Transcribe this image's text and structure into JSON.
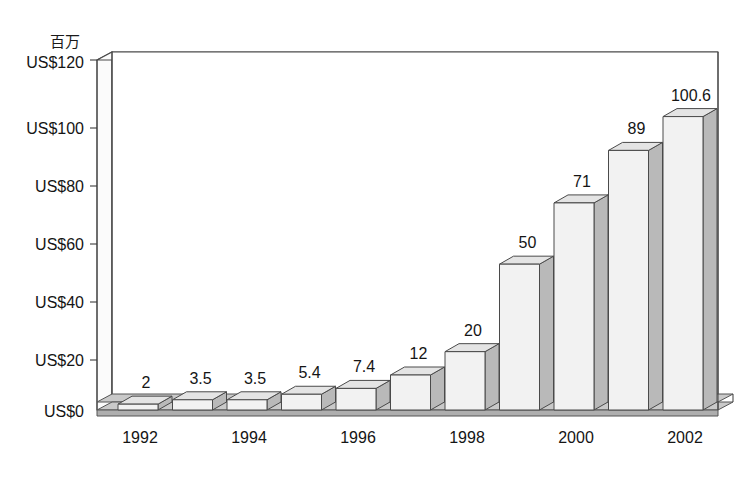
{
  "chart_data": {
    "type": "bar",
    "title": "",
    "subtitle": "",
    "xlabel": "",
    "ylabel": "百万",
    "unit_label": "百万",
    "categories": [
      "1992",
      "1993",
      "1994",
      "1995",
      "1996",
      "1997",
      "1998",
      "1999",
      "2000",
      "2001",
      "2002"
    ],
    "values": [
      2,
      3.5,
      3.5,
      5.4,
      7.4,
      12,
      20,
      50,
      71,
      89,
      100.6
    ],
    "value_labels": [
      "2",
      "3.5",
      "3.5",
      "5.4",
      "7.4",
      "12",
      "20",
      "50",
      "71",
      "89",
      "100.6"
    ],
    "x_tick_labels": [
      "1992",
      "",
      "1994",
      "",
      "1996",
      "",
      "1998",
      "",
      "2000",
      "",
      "2002"
    ],
    "visible_x_tick_labels": [
      "1992",
      "1994",
      "1996",
      "1998",
      "2000",
      "2002"
    ],
    "y_tick_labels": [
      "US$0",
      "US$20",
      "US$40",
      "US$60",
      "US$80",
      "US$100",
      "US$120"
    ],
    "y_tick_values": [
      0,
      20,
      40,
      60,
      80,
      100,
      120
    ],
    "ylim": [
      0,
      120
    ],
    "grid": false,
    "legend": false,
    "legend_position": "none",
    "style": "3d-column",
    "series": [
      {
        "name": "",
        "values": [
          2,
          3.5,
          3.5,
          5.4,
          7.4,
          12,
          20,
          50,
          71,
          89,
          100.6
        ]
      }
    ],
    "colors": {
      "bar_front": "#f2f2f2",
      "bar_side": "#b9b9b9",
      "bar_top": "#e4e4e4",
      "floor": "#c9c9c9",
      "outline": "#4a4a4a",
      "text": "#151515",
      "background": "#ffffff"
    }
  },
  "axis": {
    "unit_label": "百万",
    "y_ticks": [
      {
        "label": "US$120",
        "value": 120
      },
      {
        "label": "US$100",
        "value": 100
      },
      {
        "label": "US$80",
        "value": 80
      },
      {
        "label": "US$60",
        "value": 60
      },
      {
        "label": "US$40",
        "value": 40
      },
      {
        "label": "US$20",
        "value": 20
      },
      {
        "label": "US$0",
        "value": 0
      }
    ],
    "x_ticks": [
      {
        "label": "1992",
        "index": 0
      },
      {
        "label": "1994",
        "index": 2
      },
      {
        "label": "1996",
        "index": 4
      },
      {
        "label": "1998",
        "index": 6
      },
      {
        "label": "2000",
        "index": 8
      },
      {
        "label": "2002",
        "index": 10
      }
    ]
  },
  "caption": {
    "text": ""
  }
}
